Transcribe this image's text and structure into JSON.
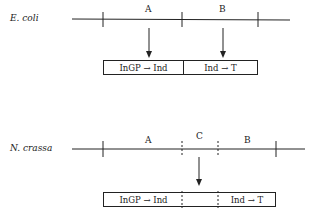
{
  "ecoli": {
    "organism": "E. coli",
    "gene_labels": [
      "A",
      "B"
    ],
    "enzyme_segments": [
      "InGP → Ind",
      "Ind → T"
    ]
  },
  "ncrassa": {
    "organism": "N. crassa",
    "gene_labels": [
      "A",
      "C",
      "B"
    ],
    "enzyme_segments": [
      "InGP → Ind",
      "",
      "Ind → T"
    ]
  }
}
